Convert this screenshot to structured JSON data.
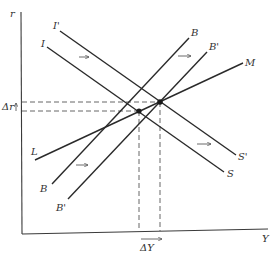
{
  "diagram": {
    "type": "IS-LM-BP economic diagram",
    "axes": {
      "y_label": "r",
      "x_label": "Y"
    },
    "curves": [
      {
        "id": "I",
        "label": "I",
        "end_label": "S",
        "description": "IS curve"
      },
      {
        "id": "I_prime",
        "label": "I'",
        "end_label": "S'",
        "description": "shifted IS curve"
      },
      {
        "id": "L",
        "label": "L",
        "end_label": "M",
        "description": "LM curve"
      },
      {
        "id": "B",
        "label": "B",
        "end_label": "B",
        "description": "BP curve"
      },
      {
        "id": "B_prime",
        "label": "B'",
        "end_label": "B'",
        "description": "shifted BP curve"
      }
    ],
    "labels": {
      "r": "r",
      "Y": "Y",
      "I": "I",
      "I_prime": "I'",
      "S": "S",
      "S_prime": "S'",
      "L": "L",
      "M": "M",
      "B_top": "B",
      "B_bottom": "B",
      "B_prime_top": "B'",
      "B_prime_bottom": "B'",
      "delta_r": "Δr",
      "delta_Y": "ΔY"
    },
    "equilibria": [
      {
        "name": "initial-equilibrium",
        "curves": [
          "I",
          "L"
        ]
      },
      {
        "name": "new-equilibrium",
        "curves": [
          "I_prime",
          "L",
          "B_prime"
        ]
      }
    ],
    "shift_arrows": [
      "IS shift right",
      "BP shift right (upper)",
      "BP shift right (lower)",
      "IS shift right (lower)"
    ]
  }
}
